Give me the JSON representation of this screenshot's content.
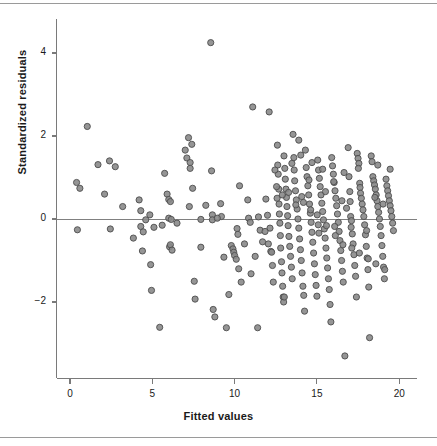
{
  "figure": {
    "background": "#ffffff",
    "top_rule": true,
    "bottom_rule": true,
    "rule_color": "#9a9a9a"
  },
  "chart_data": {
    "type": "scatter",
    "title": "",
    "xlabel": "Fitted values",
    "ylabel": "Standardized residuals",
    "xlim": [
      -0.9,
      21.2
    ],
    "ylim": [
      -3.65,
      4.75
    ],
    "xticks": [
      0,
      5,
      10,
      15,
      20
    ],
    "xticklabels": [
      "0",
      "5",
      "10",
      "15",
      "20"
    ],
    "yticks": [
      -2,
      0,
      2,
      4
    ],
    "yticklabels": [
      "−2",
      "0",
      "2",
      "4"
    ],
    "grid": false,
    "legend": null,
    "reference_line": {
      "y": 0,
      "color": "#808080",
      "width": 1
    },
    "marker": {
      "shape": "circle",
      "radius_px": 3.1,
      "fill": "#8a8a8a",
      "stroke": "#4d4d4d",
      "stroke_width": 0.9,
      "opacity": 0.9
    },
    "axis_color": "#7a7a7a",
    "n_points": 268,
    "points": [
      [
        0.4,
        0.88
      ],
      [
        0.45,
        -0.26
      ],
      [
        0.6,
        0.74
      ],
      [
        1.05,
        2.23
      ],
      [
        1.7,
        1.31
      ],
      [
        2.4,
        1.4
      ],
      [
        2.45,
        -0.24
      ],
      [
        2.75,
        1.26
      ],
      [
        3.85,
        -0.46
      ],
      [
        4.2,
        0.46
      ],
      [
        4.3,
        0.2
      ],
      [
        4.3,
        -0.18
      ],
      [
        4.45,
        -0.31
      ],
      [
        4.4,
        -0.77
      ],
      [
        4.85,
        0.1
      ],
      [
        4.9,
        -1.1
      ],
      [
        4.95,
        -1.72
      ],
      [
        5.1,
        -0.2
      ],
      [
        5.45,
        -2.61
      ],
      [
        5.75,
        1.1
      ],
      [
        5.9,
        0.6
      ],
      [
        6.0,
        0.47
      ],
      [
        6.0,
        0.02
      ],
      [
        6.05,
        -0.67
      ],
      [
        6.1,
        0.42
      ],
      [
        6.1,
        -0.62
      ],
      [
        6.15,
        -0.01
      ],
      [
        6.2,
        -0.75
      ],
      [
        7.0,
        1.66
      ],
      [
        7.1,
        1.47
      ],
      [
        7.2,
        1.96
      ],
      [
        7.25,
        0.3
      ],
      [
        7.3,
        1.36
      ],
      [
        7.3,
        1.22
      ],
      [
        7.4,
        1.8
      ],
      [
        7.45,
        0.74
      ],
      [
        7.55,
        -1.5
      ],
      [
        7.6,
        -1.93
      ],
      [
        7.95,
        -0.01
      ],
      [
        7.95,
        -0.68
      ],
      [
        8.25,
        0.33
      ],
      [
        8.55,
        4.25
      ],
      [
        8.6,
        1.16
      ],
      [
        8.65,
        0.1
      ],
      [
        8.65,
        -0.02
      ],
      [
        8.7,
        -2.18
      ],
      [
        8.8,
        -2.36
      ],
      [
        9.15,
        0.37
      ],
      [
        9.35,
        -0.92
      ],
      [
        9.5,
        -2.62
      ],
      [
        9.65,
        -1.82
      ],
      [
        9.8,
        -0.64
      ],
      [
        9.9,
        -0.72
      ],
      [
        9.95,
        -0.8
      ],
      [
        10.0,
        -0.88
      ],
      [
        10.1,
        -0.97
      ],
      [
        10.15,
        -0.23
      ],
      [
        10.2,
        -0.37
      ],
      [
        10.25,
        -1.2
      ],
      [
        10.3,
        0.8
      ],
      [
        10.4,
        -1.52
      ],
      [
        10.8,
        0.46
      ],
      [
        10.85,
        0.02
      ],
      [
        10.95,
        -0.08
      ],
      [
        11.0,
        -1.32
      ],
      [
        11.1,
        2.7
      ],
      [
        11.4,
        -2.62
      ],
      [
        11.45,
        0.05
      ],
      [
        11.55,
        -0.27
      ],
      [
        11.7,
        -0.55
      ],
      [
        11.9,
        0.48
      ],
      [
        12.0,
        0.09
      ],
      [
        12.1,
        2.58
      ],
      [
        12.15,
        -0.22
      ],
      [
        12.2,
        -0.78
      ],
      [
        12.25,
        -0.8
      ],
      [
        12.3,
        -1.12
      ],
      [
        12.6,
        1.78
      ],
      [
        12.62,
        1.3
      ],
      [
        12.65,
        1.08
      ],
      [
        12.68,
        0.72
      ],
      [
        12.7,
        0.36
      ],
      [
        12.72,
        0.12
      ],
      [
        12.75,
        -0.1
      ],
      [
        12.78,
        -0.4
      ],
      [
        12.8,
        -0.7
      ],
      [
        12.85,
        -1.03
      ],
      [
        12.88,
        -1.3
      ],
      [
        12.92,
        -1.62
      ],
      [
        12.95,
        -1.88
      ],
      [
        12.98,
        -2.0
      ],
      [
        13.0,
        1.52
      ],
      [
        13.05,
        1.22
      ],
      [
        13.08,
        0.96
      ],
      [
        13.12,
        0.72
      ],
      [
        13.15,
        0.52
      ],
      [
        13.18,
        0.3
      ],
      [
        13.22,
        0.08
      ],
      [
        13.25,
        -0.16
      ],
      [
        13.3,
        -0.42
      ],
      [
        13.35,
        -0.66
      ],
      [
        13.4,
        -0.9
      ],
      [
        13.45,
        -1.16
      ],
      [
        13.5,
        -1.44
      ],
      [
        13.55,
        2.04
      ],
      [
        13.6,
        1.48
      ],
      [
        13.62,
        1.18
      ],
      [
        13.65,
        0.92
      ],
      [
        13.7,
        0.68
      ],
      [
        13.75,
        0.46
      ],
      [
        13.8,
        0.24
      ],
      [
        13.85,
        0.0
      ],
      [
        13.9,
        -0.22
      ],
      [
        13.95,
        -0.48
      ],
      [
        14.0,
        -0.74
      ],
      [
        14.05,
        -1.0
      ],
      [
        14.1,
        -1.3
      ],
      [
        14.15,
        -1.62
      ],
      [
        14.2,
        -1.84
      ],
      [
        14.25,
        -2.22
      ],
      [
        14.3,
        1.66
      ],
      [
        14.35,
        1.24
      ],
      [
        14.4,
        1.02
      ],
      [
        14.45,
        0.8
      ],
      [
        14.5,
        0.58
      ],
      [
        14.55,
        0.36
      ],
      [
        14.6,
        0.14
      ],
      [
        14.65,
        -0.08
      ],
      [
        14.7,
        -0.32
      ],
      [
        14.75,
        -0.56
      ],
      [
        14.8,
        -0.82
      ],
      [
        14.85,
        -1.08
      ],
      [
        14.9,
        -1.34
      ],
      [
        14.95,
        -1.6
      ],
      [
        15.0,
        -1.86
      ],
      [
        15.05,
        1.42
      ],
      [
        15.1,
        1.18
      ],
      [
        15.15,
        0.98
      ],
      [
        15.2,
        0.78
      ],
      [
        15.25,
        0.58
      ],
      [
        15.3,
        0.38
      ],
      [
        15.35,
        0.18
      ],
      [
        15.4,
        -0.02
      ],
      [
        15.45,
        -0.24
      ],
      [
        15.5,
        -0.46
      ],
      [
        15.55,
        -0.7
      ],
      [
        15.6,
        -0.94
      ],
      [
        15.65,
        -1.18
      ],
      [
        15.7,
        -1.44
      ],
      [
        15.75,
        -1.7
      ],
      [
        15.8,
        -2.06
      ],
      [
        15.85,
        -2.48
      ],
      [
        15.9,
        1.48
      ],
      [
        15.95,
        1.28
      ],
      [
        16.0,
        1.08
      ],
      [
        16.05,
        0.88
      ],
      [
        16.1,
        0.68
      ],
      [
        16.15,
        0.5
      ],
      [
        16.2,
        0.32
      ],
      [
        16.25,
        0.12
      ],
      [
        16.3,
        -0.08
      ],
      [
        16.35,
        -0.3
      ],
      [
        16.4,
        -0.52
      ],
      [
        16.45,
        -0.76
      ],
      [
        16.5,
        -1.0
      ],
      [
        16.55,
        -1.26
      ],
      [
        16.6,
        -1.52
      ],
      [
        16.7,
        -3.3
      ],
      [
        16.9,
        1.72
      ],
      [
        16.95,
        1.02
      ],
      [
        17.0,
        0.66
      ],
      [
        17.05,
        0.06
      ],
      [
        17.1,
        -0.04
      ],
      [
        17.15,
        -0.36
      ],
      [
        17.2,
        -0.6
      ],
      [
        17.25,
        -0.86
      ],
      [
        17.3,
        -1.12
      ],
      [
        17.35,
        -1.38
      ],
      [
        17.4,
        -1.88
      ],
      [
        17.45,
        1.58
      ],
      [
        17.5,
        1.46
      ],
      [
        17.55,
        1.34
      ],
      [
        17.6,
        0.86
      ],
      [
        17.62,
        0.76
      ],
      [
        17.65,
        0.62
      ],
      [
        17.7,
        0.5
      ],
      [
        17.75,
        0.36
      ],
      [
        17.8,
        0.22
      ],
      [
        17.85,
        0.06
      ],
      [
        17.9,
        -0.14
      ],
      [
        17.95,
        -0.38
      ],
      [
        18.0,
        -0.66
      ],
      [
        18.05,
        -0.94
      ],
      [
        18.1,
        -1.22
      ],
      [
        18.15,
        -1.64
      ],
      [
        18.2,
        -2.86
      ],
      [
        18.3,
        1.52
      ],
      [
        18.35,
        1.38
      ],
      [
        18.4,
        1.02
      ],
      [
        18.45,
        0.92
      ],
      [
        18.5,
        0.82
      ],
      [
        18.55,
        0.72
      ],
      [
        18.6,
        0.58
      ],
      [
        18.65,
        0.44
      ],
      [
        18.7,
        0.3
      ],
      [
        18.75,
        0.16
      ],
      [
        18.8,
        0.0
      ],
      [
        18.85,
        -0.18
      ],
      [
        18.9,
        -0.4
      ],
      [
        18.95,
        -0.64
      ],
      [
        19.0,
        -0.9
      ],
      [
        19.05,
        -1.16
      ],
      [
        19.1,
        -1.44
      ],
      [
        19.2,
        0.96
      ],
      [
        19.25,
        0.8
      ],
      [
        19.3,
        0.68
      ],
      [
        19.35,
        0.56
      ],
      [
        19.4,
        0.44
      ],
      [
        19.45,
        0.32
      ],
      [
        19.5,
        0.2
      ],
      [
        19.55,
        0.06
      ],
      [
        19.6,
        -0.1
      ],
      [
        19.65,
        -0.28
      ],
      [
        12.55,
        0.78
      ],
      [
        12.58,
        0.5
      ],
      [
        13.02,
        -1.88
      ],
      [
        13.48,
        1.34
      ],
      [
        14.02,
        1.54
      ],
      [
        14.08,
        0.54
      ],
      [
        14.52,
        0.94
      ],
      [
        15.02,
        0.1
      ],
      [
        15.08,
        -0.14
      ],
      [
        15.52,
        0.66
      ],
      [
        16.02,
        0.9
      ],
      [
        16.08,
        -0.18
      ],
      [
        16.52,
        0.44
      ],
      [
        17.02,
        0.42
      ],
      [
        17.08,
        -0.2
      ],
      [
        17.52,
        1.22
      ],
      [
        18.02,
        -0.28
      ],
      [
        18.52,
        0.52
      ],
      [
        19.02,
        0.36
      ],
      [
        12.9,
        0.58
      ],
      [
        13.28,
        0.64
      ],
      [
        13.72,
        0.34
      ],
      [
        14.18,
        0.4
      ],
      [
        14.62,
        0.22
      ],
      [
        15.12,
        -0.34
      ],
      [
        15.58,
        -0.16
      ],
      [
        16.12,
        -0.4
      ],
      [
        16.58,
        -0.62
      ],
      [
        17.12,
        -0.7
      ],
      [
        17.58,
        -0.82
      ],
      [
        18.12,
        -0.96
      ],
      [
        18.58,
        -1.08
      ],
      [
        19.12,
        -1.22
      ],
      [
        12.45,
        1.18
      ],
      [
        12.35,
        -1.52
      ],
      [
        13.9,
        1.9
      ],
      [
        14.7,
        1.36
      ],
      [
        16.65,
        1.12
      ],
      [
        15.35,
        1.2
      ],
      [
        16.8,
        0.26
      ],
      [
        18.7,
        1.3
      ],
      [
        19.45,
        1.2
      ],
      [
        12.05,
        -0.6
      ],
      [
        11.85,
        -0.3
      ],
      [
        11.25,
        -0.9
      ],
      [
        10.6,
        -0.6
      ],
      [
        9.2,
        0.06
      ],
      [
        8.95,
        0.02
      ],
      [
        6.5,
        -0.1
      ],
      [
        5.6,
        -0.15
      ],
      [
        4.6,
        -0.02
      ],
      [
        3.2,
        0.3
      ],
      [
        2.1,
        0.6
      ]
    ]
  }
}
